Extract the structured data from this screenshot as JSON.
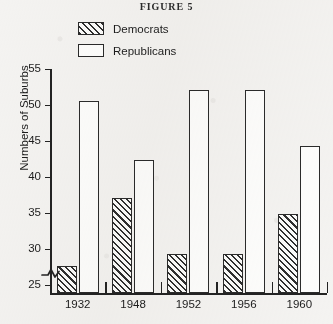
{
  "figure": {
    "title": "FIGURE 5"
  },
  "legend": {
    "position": "top-center",
    "entries": [
      {
        "label": "Democrats",
        "swatch": "hatched-box-icon"
      },
      {
        "label": "Republicans",
        "swatch": "empty-box-icon"
      }
    ]
  },
  "axes": {
    "ylabel": "Numbers of Suburbs",
    "yticks": [
      "25",
      "30",
      "35",
      "40",
      "45",
      "50",
      "55"
    ],
    "xticks": [
      "1932",
      "1948",
      "1952",
      "1956",
      "1960"
    ],
    "axis_break": "y-axis-break-icon"
  },
  "colors": {
    "ink": "#232323",
    "paper": "#f4f3f1",
    "bar_fill": "#fdfdfc",
    "hatch": "#2f2f2f"
  },
  "chart_data": {
    "type": "bar",
    "title": "FIGURE 5",
    "xlabel": "",
    "ylabel": "Numbers of Suburbs",
    "categories": [
      "1932",
      "1948",
      "1952",
      "1956",
      "1960"
    ],
    "series": [
      {
        "name": "Democrats",
        "values": [
          27.8,
          37.3,
          29.5,
          29.5,
          35.0
        ]
      },
      {
        "name": "Republicans",
        "values": [
          50.8,
          42.6,
          52.3,
          52.3,
          44.5
        ]
      }
    ],
    "ylim": [
      24,
      55
    ],
    "ytick_values": [
      25,
      30,
      35,
      40,
      45,
      50,
      55
    ],
    "grid": false,
    "legend_position": "top-center",
    "y_axis_break": true
  }
}
